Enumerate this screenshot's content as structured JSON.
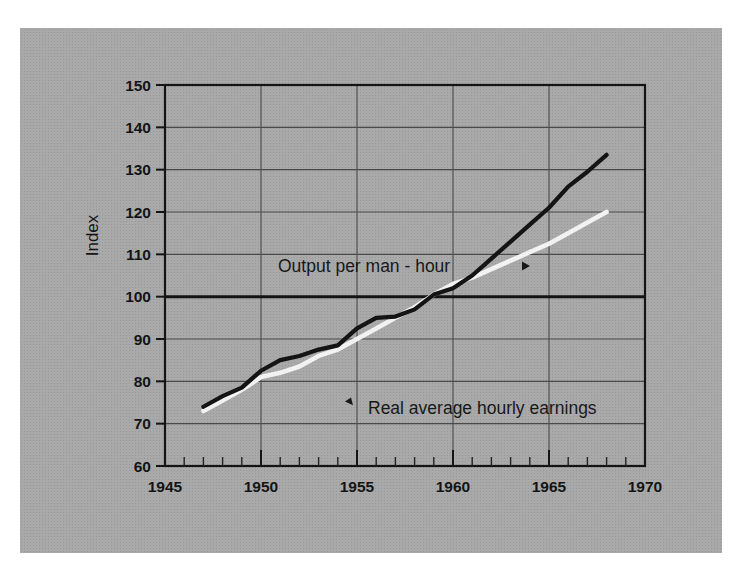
{
  "figure": {
    "background_color": "#a9a9a9",
    "page_color": "#ffffff"
  },
  "chart_data": {
    "type": "line",
    "title": "",
    "xlabel": "",
    "ylabel": "Index",
    "xlim": [
      1945,
      1970
    ],
    "ylim": [
      60,
      150
    ],
    "yticks": [
      60,
      70,
      80,
      90,
      100,
      110,
      120,
      130,
      140,
      150
    ],
    "xticks": [
      1945,
      1950,
      1955,
      1960,
      1965,
      1970
    ],
    "x_minor_tick_step": 1,
    "grid": true,
    "grid_color": "#4a4a4a",
    "reference_line": 100,
    "legend": "inline-annotations",
    "series": [
      {
        "name": "Output per man - hour",
        "color": "#141414",
        "label_text": "Output per man - hour",
        "label_arrow": "right",
        "x": [
          1947,
          1948,
          1949,
          1950,
          1951,
          1952,
          1953,
          1954,
          1955,
          1956,
          1957,
          1958,
          1959,
          1960,
          1961,
          1962,
          1963,
          1964,
          1965,
          1966,
          1967,
          1968
        ],
        "values": [
          74.0,
          76.5,
          78.5,
          82.5,
          85.0,
          86.0,
          87.5,
          88.5,
          92.5,
          95.0,
          95.3,
          97.0,
          100.5,
          102.0,
          105.0,
          109.0,
          113.0,
          117.0,
          121.0,
          126.0,
          129.5,
          133.5
        ]
      },
      {
        "name": "Real average hourly earnings",
        "color": "#f2f2f2",
        "label_text": "Real average hourly earnings",
        "label_arrow": "left",
        "x": [
          1947,
          1948,
          1949,
          1950,
          1951,
          1952,
          1953,
          1954,
          1955,
          1956,
          1957,
          1958,
          1959,
          1960,
          1961,
          1962,
          1963,
          1964,
          1965,
          1966,
          1967,
          1968
        ],
        "values": [
          73.0,
          75.5,
          78.0,
          81.0,
          82.0,
          83.5,
          86.0,
          87.5,
          90.0,
          92.5,
          95.0,
          97.5,
          100.5,
          103.0,
          104.5,
          106.5,
          108.5,
          110.5,
          112.5,
          115.0,
          117.5,
          120.0
        ]
      }
    ]
  },
  "annotations": {
    "output_label": "Output per man - hour",
    "earnings_label": "Real average hourly earnings",
    "y_axis_title": "Index"
  },
  "axis": {
    "y_tick_labels": [
      "150",
      "140",
      "130",
      "120",
      "110",
      "100",
      "90",
      "80",
      "70",
      "60"
    ],
    "x_tick_labels": [
      "1945",
      "1950",
      "1955",
      "1960",
      "1965",
      "1970"
    ]
  }
}
